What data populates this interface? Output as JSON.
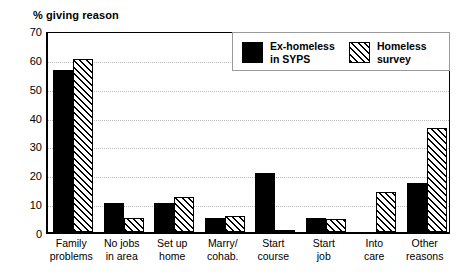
{
  "chart_data": {
    "type": "bar",
    "title": "% giving reason",
    "xlabel": "",
    "ylabel": "",
    "ylim": [
      0,
      70
    ],
    "yticks": [
      0,
      10,
      20,
      30,
      40,
      50,
      60,
      70
    ],
    "grid": "horizontal-dotted",
    "legend_position": "top-right",
    "categories": [
      "Family problems",
      "No jobs in area",
      "Set up home",
      "Marry/ cohab.",
      "Start course",
      "Start job",
      "Into care",
      "Other reasons"
    ],
    "category_lines": [
      [
        "Family",
        "problems"
      ],
      [
        "No jobs",
        "in area"
      ],
      [
        "Set up",
        "home"
      ],
      [
        "Marry/",
        "cohab."
      ],
      [
        "Start",
        "course"
      ],
      [
        "Start",
        "job"
      ],
      [
        "Into",
        "care"
      ],
      [
        "Other",
        "reasons"
      ]
    ],
    "series": [
      {
        "name": "Ex-homeless in SYPS",
        "name_lines": [
          "Ex-homeless",
          "in SYPS"
        ],
        "fill": "solid-black",
        "color": "#000000",
        "values": [
          56,
          10,
          10,
          5,
          20.5,
          5,
          0,
          17
        ]
      },
      {
        "name": "Homeless survey",
        "name_lines": [
          "Homeless",
          "survey"
        ],
        "fill": "diagonal-hatch",
        "color": "#000000",
        "values": [
          60,
          5,
          12,
          5.5,
          0.5,
          4.5,
          14,
          36
        ]
      }
    ]
  }
}
